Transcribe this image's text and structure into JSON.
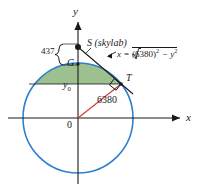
{
  "figure": {
    "axes": {
      "y_label": "y",
      "x_label": "x",
      "origin_label": "0"
    },
    "points": {
      "satellite": "S (skylab)",
      "ground": "G",
      "tangent": "T"
    },
    "measures": {
      "altitude": "437",
      "radius": "6380",
      "horizontal_height": "y",
      "horizontal_height_sub": "0"
    },
    "equation": {
      "lhs": "x",
      "equals": "=",
      "radicand_base": "(6380)",
      "radicand_exp": "2",
      "minus": "−",
      "term2_base": "y",
      "term2_exp": "2"
    },
    "colors": {
      "circle": "#2f7fd0",
      "cap_fill": "#7cab6a",
      "radius_line": "#d93a3a",
      "ink": "#1a1a1a"
    },
    "geometry": {
      "center_x": 78,
      "center_y": 118,
      "radius_px": 55,
      "S_x": 78,
      "S_y": 47,
      "T_x": 121,
      "T_y": 84
    }
  }
}
